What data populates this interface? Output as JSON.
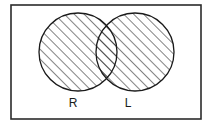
{
  "figure": {
    "type": "venn-diagram",
    "background_color": "#ffffff",
    "frame": {
      "name": "outer-frame",
      "x": 11,
      "y": 5,
      "width": 190,
      "height": 114,
      "stroke_color": "#2b2b2b",
      "stroke_width": 1.6,
      "fill": "none"
    },
    "circles": [
      {
        "id": "left-circle",
        "label": "R",
        "cx": 78,
        "cy": 52,
        "r": 39,
        "fill_pattern": "diagonal-hatch",
        "stroke_color": "#1a1a1a",
        "stroke_width": 1.3
      },
      {
        "id": "right-circle",
        "label": "L",
        "cx": 135,
        "cy": 52,
        "r": 39,
        "fill_pattern": "diagonal-hatch",
        "stroke_color": "#1a1a1a",
        "stroke_width": 1.3
      }
    ],
    "hatch": {
      "direction": "lower-left-to-upper-right",
      "angle_degrees": 45,
      "spacing_px": 7,
      "stroke_color": "#1a1a1a",
      "stroke_width": 1.1
    },
    "labels": [
      {
        "id": "label-r",
        "text": "R",
        "x": 73,
        "y": 107,
        "color": "#1a1a1a",
        "font_size": 12
      },
      {
        "id": "label-l",
        "text": "L",
        "x": 128,
        "y": 107,
        "color": "#1a1a1a",
        "font_size": 12
      }
    ]
  }
}
